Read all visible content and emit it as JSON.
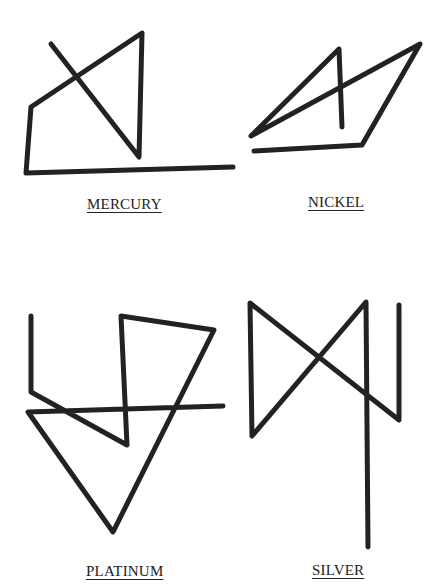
{
  "sigils": [
    {
      "name": "MERCURY",
      "points": "51,44 139,157 142,33 31,107 26,173 233,167"
    },
    {
      "name": "NICKEL",
      "points": "342,127 339,49 251,136 420,44 362,145 254,151"
    },
    {
      "name": "PLATINUM",
      "points": "31,316 31,392 127,445 121,316 214,330 113,532 28,412 223,406"
    },
    {
      "name": "SILVER",
      "points": "368,547 366,302 252,436 250,303 399,420 399,305"
    }
  ],
  "style": {
    "stroke_color": "#222222",
    "stroke_width": 5
  }
}
